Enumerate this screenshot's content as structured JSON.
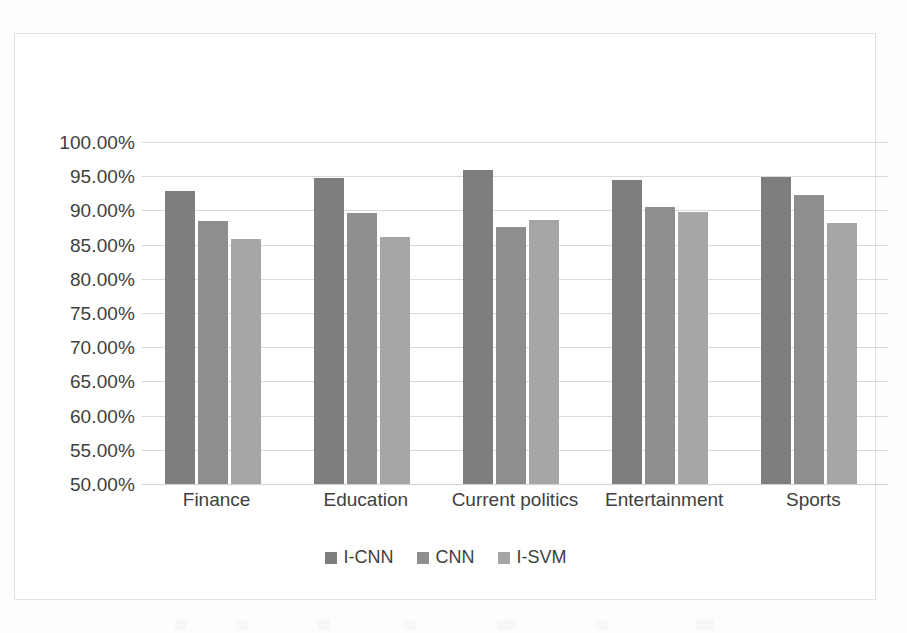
{
  "chart_data": {
    "type": "bar",
    "title": "",
    "subtitle": "",
    "xlabel": "",
    "ylabel": "",
    "categories": [
      "Finance",
      "Education",
      "Current politics",
      "Entertainment",
      "Sports"
    ],
    "series": [
      {
        "name": "I-CNN",
        "color": "#7e7e7e",
        "values": [
          92.8,
          94.7,
          95.9,
          94.5,
          94.9
        ]
      },
      {
        "name": "CNN",
        "color": "#8e8e8e",
        "values": [
          88.4,
          89.6,
          87.6,
          90.5,
          92.3
        ]
      },
      {
        "name": "I-SVM",
        "color": "#a6a6a6",
        "values": [
          85.8,
          86.1,
          88.6,
          89.8,
          88.2
        ]
      }
    ],
    "ylim": [
      50,
      100
    ],
    "ytick_step": 5,
    "ytick_labels": [
      "100.00%",
      "95.00%",
      "90.00%",
      "85.00%",
      "80.00%",
      "75.00%",
      "70.00%",
      "65.00%",
      "60.00%",
      "55.00%",
      "50.00%"
    ],
    "ytick_values": [
      100,
      95,
      90,
      85,
      80,
      75,
      70,
      65,
      60,
      55,
      50
    ],
    "value_format": "percent",
    "grid": true,
    "grid_axis": "y",
    "legend_position": "bottom",
    "background": "#ffffff",
    "border_color": "#e2e2e2",
    "gridline_color": "#d9d9d9",
    "tick_label_color": "#404040"
  }
}
